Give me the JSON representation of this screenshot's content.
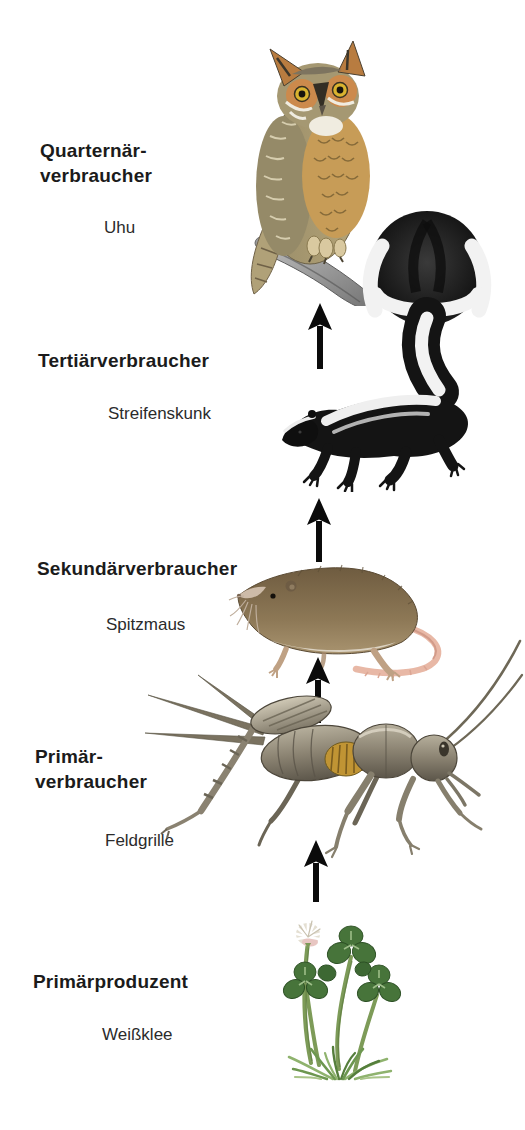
{
  "diagram": {
    "type": "food-chain",
    "background_color": "#ffffff",
    "text_color": "#1b1b1b",
    "arrow_color": "#0b0b0b",
    "levels": [
      {
        "id": "quaternary-consumer",
        "role_lines": [
          "Quarternär-",
          "verbraucher"
        ],
        "organism": "Uhu",
        "illustration": "eagle-owl-illustration"
      },
      {
        "id": "tertiary-consumer",
        "role_lines": [
          "Tertiärverbraucher"
        ],
        "organism": "Streifenskunk",
        "illustration": "striped-skunk-illustration"
      },
      {
        "id": "secondary-consumer",
        "role_lines": [
          "Sekundärverbraucher"
        ],
        "organism": "Spitzmaus",
        "illustration": "shrew-illustration"
      },
      {
        "id": "primary-consumer",
        "role_lines": [
          "Primär-",
          "verbraucher"
        ],
        "organism": "Feldgrille",
        "illustration": "field-cricket-illustration"
      },
      {
        "id": "primary-producer",
        "role_lines": [
          "Primärproduzent"
        ],
        "organism": "Weißklee",
        "illustration": "white-clover-illustration"
      }
    ],
    "arrows": [
      {
        "from": "Streifenskunk",
        "to": "Uhu",
        "direction": "up"
      },
      {
        "from": "Spitzmaus",
        "to": "Streifenskunk",
        "direction": "up"
      },
      {
        "from": "Feldgrille",
        "to": "Spitzmaus",
        "direction": "up"
      },
      {
        "from": "Weißklee",
        "to": "Feldgrille",
        "direction": "up"
      }
    ]
  }
}
